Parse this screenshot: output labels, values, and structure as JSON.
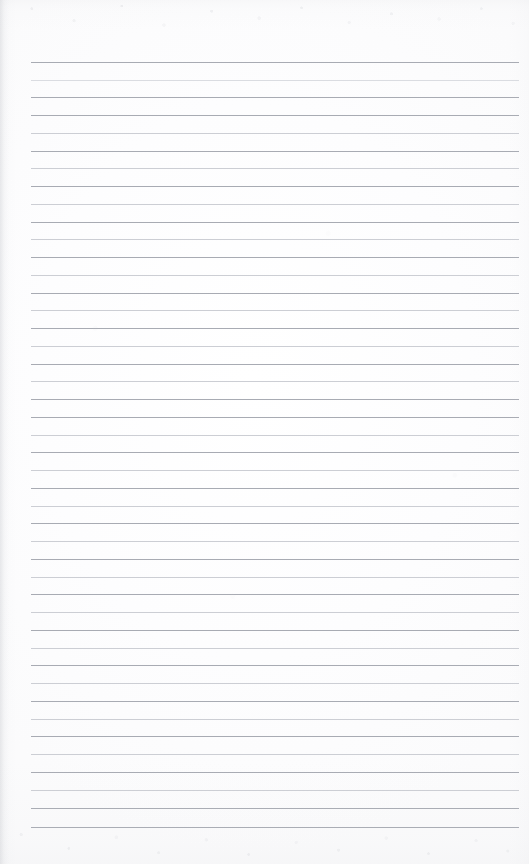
{
  "document": {
    "type": "scanned-page",
    "title": "Blank lined notebook page",
    "content_text": "",
    "is_blank": true,
    "page_width": 529,
    "page_height": 864,
    "background_color": "#fdfdfd",
    "paper_tone": "#ffffff"
  },
  "ruling": {
    "style": "horizontal-ruled",
    "line_count": 44,
    "first_line_y": 62,
    "line_spacing": 17.75,
    "line_left_x": 31,
    "line_right_x": 519,
    "line_width": 488,
    "line_thickness": 1,
    "line_color": "#b6b9c0",
    "line_color_dark": "#a8abb3",
    "line_color_light": "#ccced4",
    "line_color_faint": "#dadce1",
    "margin_top": 62,
    "margin_bottom": 37,
    "margin_left": 31,
    "margin_right": 10,
    "has_vertical_margin_rule": false,
    "lines": [
      {
        "index": 1,
        "y": 62,
        "ink": "ink-dark"
      },
      {
        "index": 2,
        "y": 80,
        "ink": "ink-faint"
      },
      {
        "index": 3,
        "y": 97,
        "ink": "ink-dark"
      },
      {
        "index": 4,
        "y": 115,
        "ink": "ink-dark"
      },
      {
        "index": 5,
        "y": 133,
        "ink": "ink-light"
      },
      {
        "index": 6,
        "y": 151,
        "ink": "ink-dark"
      },
      {
        "index": 7,
        "y": 168,
        "ink": "ink-light"
      },
      {
        "index": 8,
        "y": 186,
        "ink": "ink-dark"
      },
      {
        "index": 9,
        "y": 204,
        "ink": "ink-light"
      },
      {
        "index": 10,
        "y": 222,
        "ink": "ink-dark"
      },
      {
        "index": 11,
        "y": 239,
        "ink": "ink-light"
      },
      {
        "index": 12,
        "y": 257,
        "ink": "ink-dark"
      },
      {
        "index": 13,
        "y": 275,
        "ink": "ink-light"
      },
      {
        "index": 14,
        "y": 293,
        "ink": "ink-dark"
      },
      {
        "index": 15,
        "y": 310,
        "ink": "ink-light"
      },
      {
        "index": 16,
        "y": 328,
        "ink": "ink-dark"
      },
      {
        "index": 17,
        "y": 346,
        "ink": "ink-light"
      },
      {
        "index": 18,
        "y": 364,
        "ink": "ink-dark"
      },
      {
        "index": 19,
        "y": 381,
        "ink": "ink-light"
      },
      {
        "index": 20,
        "y": 399,
        "ink": "ink-dark"
      },
      {
        "index": 21,
        "y": 417,
        "ink": "ink-dark"
      },
      {
        "index": 22,
        "y": 435,
        "ink": "ink-light"
      },
      {
        "index": 23,
        "y": 452,
        "ink": "ink-dark"
      },
      {
        "index": 24,
        "y": 470,
        "ink": "ink-light"
      },
      {
        "index": 25,
        "y": 488,
        "ink": "ink-dark"
      },
      {
        "index": 26,
        "y": 506,
        "ink": "ink-light"
      },
      {
        "index": 27,
        "y": 523,
        "ink": "ink-dark"
      },
      {
        "index": 28,
        "y": 541,
        "ink": "ink-light"
      },
      {
        "index": 29,
        "y": 559,
        "ink": "ink-dark"
      },
      {
        "index": 30,
        "y": 577,
        "ink": "ink-light"
      },
      {
        "index": 31,
        "y": 594,
        "ink": "ink-dark"
      },
      {
        "index": 32,
        "y": 612,
        "ink": "ink-light"
      },
      {
        "index": 33,
        "y": 630,
        "ink": "ink-dark"
      },
      {
        "index": 34,
        "y": 648,
        "ink": "ink-light"
      },
      {
        "index": 35,
        "y": 665,
        "ink": "ink-dark"
      },
      {
        "index": 36,
        "y": 683,
        "ink": "ink-light"
      },
      {
        "index": 37,
        "y": 701,
        "ink": "ink-dark"
      },
      {
        "index": 38,
        "y": 719,
        "ink": "ink-light"
      },
      {
        "index": 39,
        "y": 736,
        "ink": "ink-dark"
      },
      {
        "index": 40,
        "y": 754,
        "ink": "ink-light"
      },
      {
        "index": 41,
        "y": 772,
        "ink": "ink-dark"
      },
      {
        "index": 42,
        "y": 790,
        "ink": "ink-light"
      },
      {
        "index": 43,
        "y": 808,
        "ink": "ink-dark"
      },
      {
        "index": 44,
        "y": 827,
        "ink": "ink-dark"
      }
    ]
  },
  "scan_artifacts": {
    "top_edge_noise": true,
    "bottom_edge_noise": true,
    "left_edge_shadow": true,
    "noise_color": "#b4b7be"
  }
}
